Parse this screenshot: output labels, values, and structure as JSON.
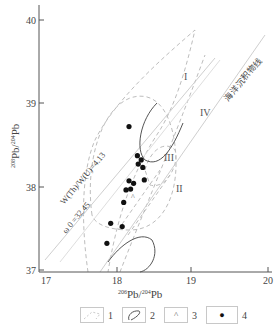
{
  "chart_data": {
    "type": "scatter",
    "title": "",
    "xlabel": "206Pb/204Pb",
    "ylabel": "208Pb/204Pb",
    "xlabel_sup": "206",
    "xlabel_sup2": "204",
    "ylabel_sup": "208",
    "ylabel_sup2": "204",
    "xlim": [
      17,
      20
    ],
    "ylim": [
      37,
      40.2
    ],
    "x_ticks": [
      "17",
      "18",
      "19",
      "20"
    ],
    "y_ticks": [
      "37",
      "38",
      "39",
      "40"
    ],
    "grid": false,
    "series": [
      {
        "name": "4",
        "marker": "filled-circle",
        "points": [
          {
            "x": 18.18,
            "y": 38.72
          },
          {
            "x": 18.29,
            "y": 38.37
          },
          {
            "x": 18.34,
            "y": 38.32
          },
          {
            "x": 18.3,
            "y": 38.27
          },
          {
            "x": 18.36,
            "y": 38.23
          },
          {
            "x": 18.18,
            "y": 38.07
          },
          {
            "x": 18.24,
            "y": 38.04
          },
          {
            "x": 18.38,
            "y": 38.08
          },
          {
            "x": 18.14,
            "y": 37.96
          },
          {
            "x": 18.2,
            "y": 37.97
          },
          {
            "x": 18.11,
            "y": 37.81
          },
          {
            "x": 17.94,
            "y": 37.56
          },
          {
            "x": 18.09,
            "y": 37.52
          },
          {
            "x": 17.89,
            "y": 37.32
          }
        ]
      }
    ],
    "region_labels": [
      "I",
      "II",
      "III",
      "IV"
    ],
    "annotations": {
      "ratio_line": "W(Th)/W(U)=4.13",
      "omega_line": "ω 0 =32.45",
      "ocean_line": "海洋沉积物线"
    },
    "legend": [
      {
        "num": "1",
        "symbol": "dashed-field"
      },
      {
        "num": "2",
        "symbol": "solid-curve"
      },
      {
        "num": "3",
        "symbol": "caret"
      },
      {
        "num": "4",
        "symbol": "filled-circle"
      }
    ],
    "legend_position": "bottom"
  },
  "labels": {
    "caret_glyph": "^",
    "dot_glyph": "●"
  }
}
